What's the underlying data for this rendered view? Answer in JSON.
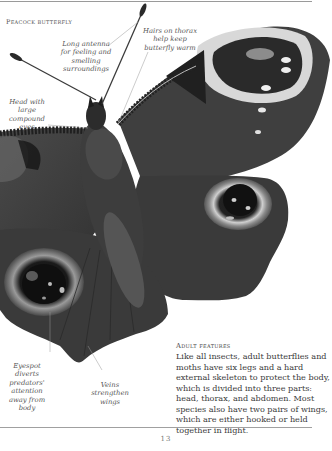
{
  "page": {
    "title": "Peacock butterfly",
    "page_number": "13"
  },
  "labels": {
    "antenna": "Long antenna for feeling and smelling surroundings",
    "hairs": "Hairs on thorax help keep butterfly warm",
    "head": "Head with large compound eyes",
    "eyespot": "Eyespot diverts predators' attention away from body",
    "veins": "Veins strengthen wings"
  },
  "features": {
    "title": "Adult features",
    "body": "Like all insects, adult butterflies and moths have six legs and a hard external skeleton to protect the body, which is divided into three parts: head, thorax, and abdomen. Most species also have two pairs of wings, which are either hooked or held together in flight."
  },
  "colors": {
    "background": "#ffffff",
    "wing_dark": "#3c3c3c",
    "text": "#3a3a3a"
  }
}
